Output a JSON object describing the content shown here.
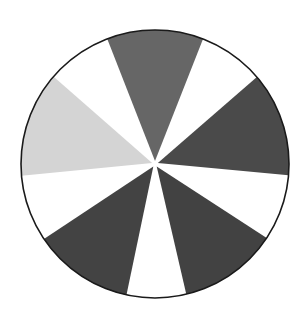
{
  "diagram": {
    "type": "segmented-circle",
    "center": [
      155,
      164
    ],
    "radius": 134,
    "inner_gap": 3,
    "outline_color": "#1a1a1a",
    "background_color": "#ffffff",
    "sectors": [
      {
        "name": "top",
        "start_deg": -110.9,
        "end_deg": -69.0,
        "color": "#666666"
      },
      {
        "name": "upper-right-white",
        "start_deg": -69.0,
        "end_deg": -40.5,
        "color": "#ffffff"
      },
      {
        "name": "right",
        "start_deg": -40.5,
        "end_deg": 4.8,
        "color": "#4a4a4a"
      },
      {
        "name": "right-white",
        "start_deg": 4.8,
        "end_deg": 33.5,
        "color": "#ffffff"
      },
      {
        "name": "lower-right",
        "start_deg": 33.5,
        "end_deg": 76.5,
        "color": "#424242"
      },
      {
        "name": "bottom-white",
        "start_deg": 76.5,
        "end_deg": 102.3,
        "color": "#ffffff"
      },
      {
        "name": "lower-left",
        "start_deg": 102.3,
        "end_deg": 146.0,
        "color": "#434343"
      },
      {
        "name": "left-white",
        "start_deg": 146.0,
        "end_deg": 175.0,
        "color": "#ffffff"
      },
      {
        "name": "left-light",
        "start_deg": 175.0,
        "end_deg": 220.7,
        "color": "#d4d4d4"
      },
      {
        "name": "upper-left-white",
        "start_deg": 220.7,
        "end_deg": 249.1,
        "color": "#ffffff"
      }
    ]
  }
}
